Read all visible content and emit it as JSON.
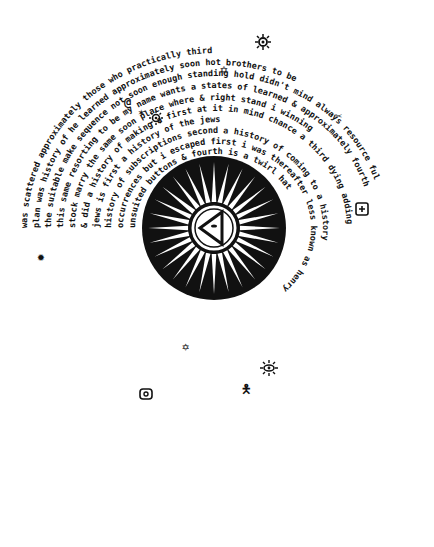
{
  "artwork": {
    "description": "Hand-drawn circular spiral text mandala with a black sunburst medallion at the center containing an eye-in-triangle",
    "colors": {
      "ink": "#111111",
      "paper": "#ffffff"
    },
    "center_emblem": {
      "type": "sunburst-medallion",
      "rays": 28,
      "inner_symbol": "eye-in-triangle"
    },
    "rings": [
      "the jews second to be in sequence",
      "was scattered approximately those who practically third",
      "plan was history of he learned approximately soon hot brothers to be",
      "the suitable make sequence not soon enough standing hold didn't mind always resource ful",
      "this same resorting to be my name wants a states of learned & approximately fourth",
      "stock marry the same soon place where & right stand i winning",
      "& did a history of making a first at it in mind chance a third dying adding",
      "jews is first a history of the jews",
      "history of subscriptions second a history of coming to a history",
      "unsuited buttons & fourth is a twirl hat",
      "much the same way asked him to write i had",
      "same matter position as those unlettered tribes the",
      "different because i regret the strain it puts on our resources soon",
      "occurrences but i escaped first i was thereafter less known as henry",
      "learning the order of their resources was each one than useful appear",
      "scoring or resorting i learned made us practically brothers myself in",
      "approximately the same sequence this made us practically mind i told him first",
      "this practically didn't mind that brothers didn't mind aforementioned points but soon",
      "not at all he was remiss on only one of the aforementioned points"
    ],
    "visible_phrases": [
      "the jews second",
      "scattered or approximately those",
      "to be in sequence",
      "he learned who approximately",
      "not soon enough",
      "made sequence",
      "place where",
      "to be my name",
      "it in mind",
      "making a",
      "first at",
      "jews is first a history",
      "subscriptions",
      "second a history of coming",
      "unsuited buttons",
      "& fourth",
      "asked him",
      "much the same way",
      "position as those",
      "unlettered",
      "i regret the strain it puts on our resources",
      "i escaped first i was thereafter less",
      "known as henry",
      "the order of their resources",
      "i learned each one",
      "scoring or resorting",
      "made us practically brothers",
      "the same sequence",
      "this",
      "practically didn't mind that brothers",
      "didn't mind",
      "not at all",
      "he was remiss on only one of the aforementioned points",
      "i told him first",
      "but soon",
      "myself in",
      "than useful",
      "to be always resource ful",
      "didn't mind",
      "& fourth",
      "winning",
      "learned & also",
      "approximately",
      "weaving learning"
    ],
    "symbols": [
      {
        "name": "sun-glyph",
        "x": 263,
        "y": 42
      },
      {
        "name": "star-glyph",
        "x": 226,
        "y": 69
      },
      {
        "name": "spiral-glyph",
        "x": 130,
        "y": 101
      },
      {
        "name": "star-glyph",
        "x": 144,
        "y": 111
      },
      {
        "name": "sun-glyph",
        "x": 156,
        "y": 117
      },
      {
        "name": "scissors-glyph",
        "x": 341,
        "y": 115
      },
      {
        "name": "boxed-plus-glyph",
        "x": 362,
        "y": 209
      },
      {
        "name": "star-glyph",
        "x": 43,
        "y": 256
      },
      {
        "name": "star-glyph",
        "x": 188,
        "y": 346
      },
      {
        "name": "sun-glyph",
        "x": 269,
        "y": 367
      },
      {
        "name": "figure-glyph",
        "x": 246,
        "y": 388
      },
      {
        "name": "boxed-circle-glyph",
        "x": 146,
        "y": 394
      }
    ]
  }
}
